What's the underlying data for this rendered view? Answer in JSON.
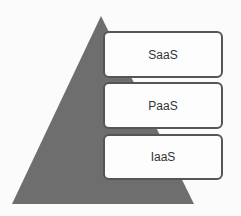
{
  "diagram": {
    "type": "pyramid",
    "layers": [
      {
        "label": "SaaS"
      },
      {
        "label": "PaaS"
      },
      {
        "label": "IaaS"
      }
    ],
    "colors": {
      "pyramid": "#6e6e6e",
      "box_fill": "#fdfdfd",
      "box_border": "#555555"
    }
  }
}
